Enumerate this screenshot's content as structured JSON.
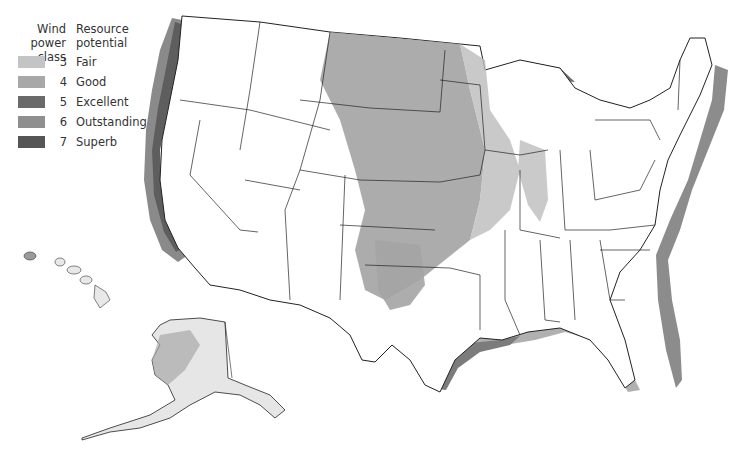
{
  "legend": {
    "header_class": "Wind\npower class",
    "header_class_line1": "Wind",
    "header_class_line2": "power class",
    "header_potential_line1": "Resource",
    "header_potential_line2": "potential",
    "items": [
      {
        "class": "3",
        "label": "Fair",
        "color": "#c4c4c4"
      },
      {
        "class": "4",
        "label": "Good",
        "color": "#a8a8a8"
      },
      {
        "class": "5",
        "label": "Excellent",
        "color": "#6a6a6a"
      },
      {
        "class": "6",
        "label": "Outstanding",
        "color": "#8f8f8f"
      },
      {
        "class": "7",
        "label": "Superb",
        "color": "#555555"
      }
    ]
  },
  "map": {
    "regions": [
      "Contiguous United States",
      "Hawaii",
      "Alaska"
    ],
    "colors": {
      "land": "#ffffff",
      "border": "#222222",
      "offshore_fair": "#c4c4c4",
      "offshore_good": "#a8a8a8",
      "offshore_excellent": "#6a6a6a",
      "plains_high": "#9a9a9a",
      "plains_mid": "#b4b4b4"
    }
  }
}
